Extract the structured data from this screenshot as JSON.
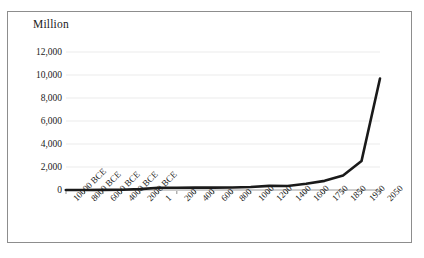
{
  "figure": {
    "axis_label": "Million",
    "border_color": "#8d8d8d",
    "line_color": "#1a1a1a",
    "gridline_color": "#ebebeb",
    "background": "#ffffff"
  },
  "chart_data": {
    "type": "line",
    "title": "",
    "subtitle": "",
    "xlabel": "",
    "ylabel": "Million",
    "ylim": [
      0,
      12000
    ],
    "yticks": [
      0,
      2000,
      4000,
      6000,
      8000,
      10000,
      12000
    ],
    "ytick_labels": [
      "0",
      "2,000",
      "4,000",
      "6,000",
      "8,000",
      "10,000",
      "12,000"
    ],
    "grid": true,
    "grid_axis": "y",
    "legend": false,
    "legend_position": "none",
    "categories": [
      "10000 BCE",
      "8000 BCE",
      "6000 BCE",
      "4000 BCE",
      "2000 BCE",
      "1",
      "200",
      "400",
      "600",
      "800",
      "1000",
      "1200",
      "1400",
      "1600",
      "1750",
      "1850",
      "1950",
      "2050"
    ],
    "series": [
      {
        "name": "World population",
        "values": [
          4,
          5,
          7,
          28,
          72,
          190,
          190,
          206,
          206,
          220,
          265,
          360,
          350,
          545,
          795,
          1265,
          2525,
          9700
        ]
      }
    ],
    "annotations": []
  }
}
